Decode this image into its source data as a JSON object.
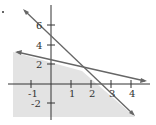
{
  "chart_data": {
    "type": "line",
    "title": "",
    "xlabel": "",
    "ylabel": "",
    "xlim": [
      -1.9,
      4.8
    ],
    "ylim": [
      -3.4,
      6.5
    ],
    "grid": false,
    "x_ticks": [
      "-1",
      "1",
      "2",
      "3",
      "4"
    ],
    "y_ticks": [
      "6",
      "4",
      "2",
      "-2"
    ],
    "series": [
      {
        "name": "line-steep",
        "equation": "y = -2x + 5",
        "points": [
          [
            -1.4,
            7.8
          ],
          [
            4.2,
            -3.4
          ]
        ]
      },
      {
        "name": "line-shallow",
        "equation": "y = -0.4x + 2.5",
        "points": [
          [
            -1.8,
            3.2
          ],
          [
            4.8,
            0.58
          ]
        ]
      }
    ],
    "shaded_region": "y <= -2x + 5 and y <= -0.4x + 2.5",
    "intersection": [
      1.56,
      1.88
    ],
    "colors": {
      "shade": "#e3e3e3",
      "line": "#666666",
      "axis": "#333333"
    }
  },
  "labels": {
    "x": [
      {
        "t": "-1",
        "x": 28,
        "y": 97
      },
      {
        "t": "1",
        "x": 69,
        "y": 97
      },
      {
        "t": "2",
        "x": 89,
        "y": 97
      },
      {
        "t": "3",
        "x": 109,
        "y": 97
      },
      {
        "t": "4",
        "x": 129,
        "y": 97
      }
    ],
    "y": [
      {
        "t": "6",
        "x": 36,
        "y": 29
      },
      {
        "t": "4",
        "x": 36,
        "y": 49
      },
      {
        "t": "2",
        "x": 36,
        "y": 68
      },
      {
        "t": "-2",
        "x": 31,
        "y": 107
      }
    ]
  }
}
